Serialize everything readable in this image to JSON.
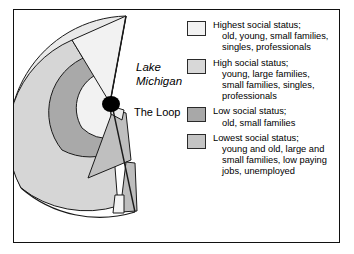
{
  "figure": {
    "type": "concentric-zone-model-diagram",
    "map": {
      "center_label": "The Loop",
      "water_label_line1": "Lake",
      "water_label_line2": "Michigan",
      "center_marker": "loop-dot"
    },
    "legend": {
      "items": [
        {
          "id": "highest-social-status",
          "swatch_color": "#f2f2f2",
          "lines": [
            "Highest social status;",
            "old, young, small families,",
            "singles, professionals"
          ]
        },
        {
          "id": "high-social-status",
          "swatch_color": "#d8d8d8",
          "lines": [
            "High social status;",
            "young, large families,",
            "small families, singles,",
            "professionals"
          ]
        },
        {
          "id": "low-social-status",
          "swatch_color": "#a8a8a8",
          "lines": [
            "Low social status;",
            "old, small families"
          ]
        },
        {
          "id": "lowest-social-status",
          "swatch_color": "#c4c4c4",
          "lines": [
            "Lowest social status;",
            "young and old, large and",
            "small families, low paying",
            "jobs, unemployed"
          ]
        }
      ]
    },
    "colors": {
      "frame_border": "#111111",
      "page_background": "#ffffff",
      "outline_stroke": "#1a1a1a",
      "zone_highest": "#f2f2f2",
      "zone_high": "#d8d8d8",
      "zone_low": "#a8a8a8",
      "zone_lowest": "#c4c4c4",
      "loop_dot": "#000000"
    }
  }
}
